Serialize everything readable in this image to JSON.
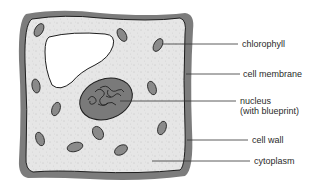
{
  "diagram": {
    "colors": {
      "cell_wall": "#7c7c7c",
      "cytoplasm": "#e4e4e4",
      "membrane": "#1e1e1e",
      "vacuole": "#ffffff",
      "chloroplast": "#8a8a8a",
      "nucleus": "#7a7a7a",
      "leader_line": "#333333"
    },
    "labels": [
      {
        "id": "chlorophyll",
        "text": "chlorophyll"
      },
      {
        "id": "cell_membrane",
        "text": "cell membrane"
      },
      {
        "id": "nucleus",
        "text": "nucleus",
        "subtext": "(with blueprint)"
      },
      {
        "id": "cell_wall",
        "text": "cell wall"
      },
      {
        "id": "cytoplasm",
        "text": "cytoplasm"
      }
    ]
  }
}
